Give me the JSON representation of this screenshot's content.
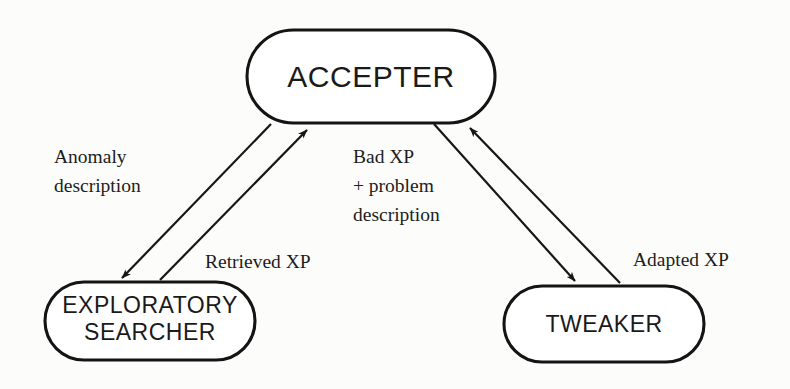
{
  "diagram": {
    "type": "flow-diagram",
    "title": "",
    "background_color": "#fcfcfa",
    "stroke_color": "#141414",
    "nodes": [
      {
        "id": "accepter",
        "label": "ACCEPTER",
        "shape": "stadium",
        "lines": [
          "ACCEPTER"
        ]
      },
      {
        "id": "exploratory-searcher",
        "label": "EXPLORATORY SEARCHER",
        "shape": "stadium",
        "lines": [
          "EXPLORATORY",
          "SEARCHER"
        ]
      },
      {
        "id": "tweaker",
        "label": "TWEAKER",
        "shape": "stadium",
        "lines": [
          "TWEAKER"
        ]
      }
    ],
    "edges": [
      {
        "id": "accepter-to-searcher",
        "from": "accepter",
        "to": "exploratory-searcher",
        "label": "Anomaly description",
        "label_lines": [
          "Anomaly",
          "description"
        ]
      },
      {
        "id": "searcher-to-accepter",
        "from": "exploratory-searcher",
        "to": "accepter",
        "label": "Retrieved XP",
        "label_lines": [
          "Retrieved XP"
        ]
      },
      {
        "id": "accepter-to-tweaker",
        "from": "accepter",
        "to": "tweaker",
        "label": "Bad XP + problem description",
        "label_lines": [
          "Bad XP",
          "+ problem",
          "description"
        ]
      },
      {
        "id": "tweaker-to-accepter",
        "from": "tweaker",
        "to": "accepter",
        "label": "Adapted XP",
        "label_lines": [
          "Adapted XP"
        ]
      }
    ]
  }
}
